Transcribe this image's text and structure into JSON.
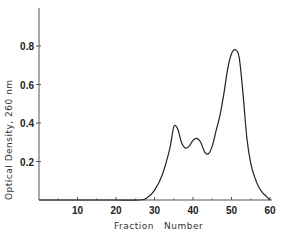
{
  "chart_data": {
    "type": "line",
    "title": "",
    "xlabel": "Fraction   Number",
    "ylabel": "Optical Density, 260 nm",
    "xlim": [
      0,
      60
    ],
    "ylim": [
      0,
      0.98
    ],
    "x_ticks": [
      "10",
      "20",
      "30",
      "40",
      "50",
      "60"
    ],
    "y_ticks": [
      "0.2",
      "0.4",
      "0.6",
      "0.8"
    ],
    "grid": false,
    "series": [
      {
        "name": "OD260",
        "x": [
          0,
          10,
          20,
          26,
          28,
          30,
          32,
          34,
          35,
          36,
          37,
          38,
          39,
          40,
          41,
          42,
          43,
          44,
          45,
          46,
          47,
          48,
          49,
          50,
          51,
          52,
          53,
          54,
          55,
          56,
          57,
          58,
          59,
          60
        ],
        "values": [
          0.0,
          0.0,
          0.0,
          0.0,
          0.01,
          0.05,
          0.13,
          0.27,
          0.38,
          0.37,
          0.3,
          0.27,
          0.28,
          0.31,
          0.32,
          0.3,
          0.25,
          0.24,
          0.28,
          0.36,
          0.44,
          0.55,
          0.68,
          0.76,
          0.78,
          0.74,
          0.55,
          0.32,
          0.19,
          0.12,
          0.07,
          0.04,
          0.02,
          0.0
        ]
      }
    ]
  }
}
